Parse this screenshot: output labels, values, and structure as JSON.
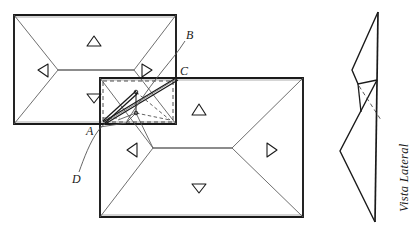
{
  "figure": {
    "background_color": "#ffffff",
    "ink_color": "#1a1a1a",
    "thin_ink_color": "#555555"
  },
  "labels": {
    "point_a": "A",
    "point_b": "B",
    "point_c": "C",
    "point_d": "D",
    "side_view": "Vista Lateral"
  },
  "arrow_markers": {
    "top_plan": [
      {
        "name": "up-triangle",
        "direction": "up"
      },
      {
        "name": "left-triangle",
        "direction": "left"
      },
      {
        "name": "right-triangle",
        "direction": "right"
      },
      {
        "name": "down-triangle",
        "direction": "down"
      }
    ],
    "bottom_plan": [
      {
        "name": "up-triangle",
        "direction": "up"
      },
      {
        "name": "left-triangle",
        "direction": "left"
      },
      {
        "name": "right-triangle",
        "direction": "right"
      },
      {
        "name": "down-triangle",
        "direction": "down"
      }
    ]
  },
  "shapes": {
    "top_plan_rect": {
      "x1": 14,
      "y1": 15,
      "x2": 176,
      "y2": 124
    },
    "bottom_plan_rect": {
      "x1": 100,
      "y1": 78,
      "x2": 303,
      "y2": 217
    },
    "detail_dashed_rect": {
      "x1": 103,
      "y1": 81,
      "x2": 173,
      "y2": 122
    },
    "side_view_spine": {
      "x1": 378,
      "y1": 12,
      "x2": 375,
      "y2": 222
    }
  }
}
